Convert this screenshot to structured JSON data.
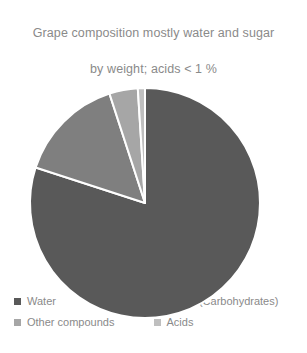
{
  "chart": {
    "title": "Grape composition mostly water and sugar\nby weight; acids < 1 %",
    "title_line1": "Grape composition mostly water and sugar",
    "title_line2": "by weight; acids < 1 %"
  },
  "legend": {
    "items": [
      {
        "label": "Water",
        "color": "#595959",
        "swatch_name": "legend-swatch-water"
      },
      {
        "label": "Sugar (Carbohydrates)",
        "color": "#7f7f7f",
        "swatch_name": "legend-swatch-sugar"
      },
      {
        "label": "Other compounds",
        "color": "#a6a6a6",
        "swatch_name": "legend-swatch-other-compounds"
      },
      {
        "label": "Acids",
        "color": "#bfbfbf",
        "swatch_name": "legend-swatch-acids"
      }
    ]
  },
  "chart_data": {
    "type": "pie",
    "title": "Grape composition mostly water and sugar by weight; acids < 1 %",
    "labels": [
      "Water",
      "Sugar (Carbohydrates)",
      "Other compounds",
      "Acids"
    ],
    "values": [
      80,
      15,
      4,
      1
    ],
    "unit": "%",
    "colors": [
      "#595959",
      "#7f7f7f",
      "#a6a6a6",
      "#bfbfbf"
    ],
    "start_angle_deg": 0,
    "direction": "clockwise",
    "legend_position": "bottom",
    "data_labels": false,
    "grid": false,
    "slice_border_color": "#ffffff",
    "slice_border_width": 2
  }
}
